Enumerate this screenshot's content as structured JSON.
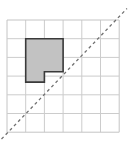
{
  "figure": {
    "caption": "",
    "background_color": "#ffffff"
  },
  "chart_data": {
    "type": "diagram-grid",
    "title": "",
    "subtitle": "",
    "xlabel": "",
    "ylabel": "",
    "grid": {
      "visible": true,
      "columns": 6,
      "rows": 6,
      "cell_size_px": 18.7,
      "origin_px": {
        "x": 7,
        "y": 20
      },
      "extent_px": {
        "x": 119.2,
        "y": 132.2
      },
      "line_color": "#c9c9c9",
      "line_width_px": 1,
      "border_color": "#bdbdbd",
      "tick_labels_x": [],
      "tick_labels_y": []
    },
    "series": [
      {
        "name": "shaded-polygon",
        "type": "polygon",
        "fill_color": "#c2c2c2",
        "stroke_color": "#3a3a3a",
        "stroke_width_px": 1.6,
        "closed": true,
        "vertices_grid": [
          {
            "col": 1,
            "row": 1
          },
          {
            "col": 3,
            "row": 1
          },
          {
            "col": 3,
            "row": 2.76
          },
          {
            "col": 2,
            "row": 2.76
          },
          {
            "col": 2,
            "row": 3.32
          },
          {
            "col": 1,
            "row": 3.32
          }
        ],
        "vertices_px": [
          {
            "x": 25.7,
            "y": 38.7
          },
          {
            "x": 63.1,
            "y": 38.7
          },
          {
            "x": 63.1,
            "y": 71.7
          },
          {
            "x": 44.4,
            "y": 71.7
          },
          {
            "x": 44.4,
            "y": 82.1
          },
          {
            "x": 25.7,
            "y": 82.1
          }
        ]
      },
      {
        "name": "dashed-diagonal-line",
        "type": "line",
        "style": "dashed",
        "stroke_color": "#707070",
        "stroke_width_px": 1.3,
        "dash_pattern_px": [
          3,
          3
        ],
        "start_px": {
          "x": 1.5,
          "y": 139.0
        },
        "end_px": {
          "x": 127.0,
          "y": 8.5
        },
        "slope": -1.04,
        "description": "diagonal from lower-left to upper-right across the grid"
      }
    ],
    "legend": {
      "visible": false,
      "position": "none",
      "entries": []
    },
    "annotations": []
  }
}
